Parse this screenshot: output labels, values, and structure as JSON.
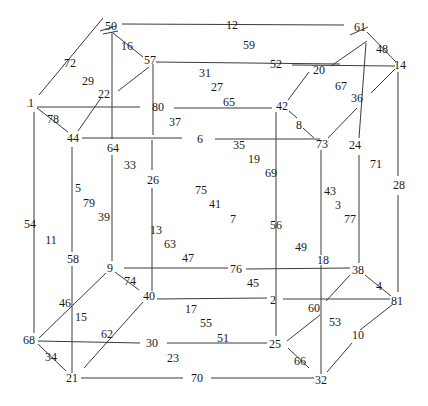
{
  "diagram": {
    "type": "nested-cube graph with numbered labels",
    "stroke_color": "#3a3a3a",
    "text_color": "#1a1a1a",
    "background": "#ffffff",
    "labels": [
      {
        "id": "50",
        "x": 111,
        "y": 26
      },
      {
        "id": "12",
        "x": 232,
        "y": 25
      },
      {
        "id": "61",
        "x": 360,
        "y": 27
      },
      {
        "id": "16",
        "x": 127,
        "y": 46
      },
      {
        "id": "57",
        "x": 150,
        "y": 60
      },
      {
        "id": "59",
        "x": 249,
        "y": 45
      },
      {
        "id": "48",
        "x": 382,
        "y": 49
      },
      {
        "id": "72",
        "x": 70,
        "y": 63
      },
      {
        "id": "52",
        "x": 276,
        "y": 64
      },
      {
        "id": "14",
        "x": 400,
        "y": 65
      },
      {
        "id": "31",
        "x": 205,
        "y": 73
      },
      {
        "id": "20",
        "x": 319,
        "y": 70
      },
      {
        "id": "29",
        "x": 88,
        "y": 81
      },
      {
        "id": "67",
        "x": 341,
        "y": 86
      },
      {
        "id": "27",
        "x": 217,
        "y": 87
      },
      {
        "id": "22",
        "x": 104,
        "y": 94
      },
      {
        "id": "36",
        "x": 357,
        "y": 98
      },
      {
        "id": "1",
        "x": 31,
        "y": 103
      },
      {
        "id": "80",
        "x": 158,
        "y": 107
      },
      {
        "id": "65",
        "x": 229,
        "y": 102
      },
      {
        "id": "42",
        "x": 282,
        "y": 106
      },
      {
        "id": "78",
        "x": 53,
        "y": 119
      },
      {
        "id": "37",
        "x": 175,
        "y": 122
      },
      {
        "id": "8",
        "x": 299,
        "y": 125
      },
      {
        "id": "44",
        "x": 73,
        "y": 138
      },
      {
        "id": "6",
        "x": 200,
        "y": 139
      },
      {
        "id": "35",
        "x": 239,
        "y": 145
      },
      {
        "id": "73",
        "x": 322,
        "y": 144
      },
      {
        "id": "24",
        "x": 355,
        "y": 145
      },
      {
        "id": "64",
        "x": 113,
        "y": 148
      },
      {
        "id": "19",
        "x": 254,
        "y": 159
      },
      {
        "id": "33",
        "x": 130,
        "y": 165
      },
      {
        "id": "71",
        "x": 376,
        "y": 164
      },
      {
        "id": "69",
        "x": 271,
        "y": 173
      },
      {
        "id": "26",
        "x": 153,
        "y": 180
      },
      {
        "id": "5",
        "x": 78,
        "y": 188
      },
      {
        "id": "43",
        "x": 330,
        "y": 191
      },
      {
        "id": "75",
        "x": 201,
        "y": 190
      },
      {
        "id": "28",
        "x": 399,
        "y": 185
      },
      {
        "id": "79",
        "x": 89,
        "y": 203
      },
      {
        "id": "41",
        "x": 215,
        "y": 204
      },
      {
        "id": "3",
        "x": 338,
        "y": 205
      },
      {
        "id": "39",
        "x": 104,
        "y": 217
      },
      {
        "id": "7",
        "x": 233,
        "y": 219
      },
      {
        "id": "77",
        "x": 350,
        "y": 219
      },
      {
        "id": "54",
        "x": 30,
        "y": 224
      },
      {
        "id": "56",
        "x": 276,
        "y": 225
      },
      {
        "id": "13",
        "x": 156,
        "y": 230
      },
      {
        "id": "11",
        "x": 51,
        "y": 240
      },
      {
        "id": "63",
        "x": 170,
        "y": 244
      },
      {
        "id": "49",
        "x": 301,
        "y": 247
      },
      {
        "id": "58",
        "x": 73,
        "y": 259
      },
      {
        "id": "47",
        "x": 188,
        "y": 258
      },
      {
        "id": "18",
        "x": 323,
        "y": 260
      },
      {
        "id": "9",
        "x": 110,
        "y": 268
      },
      {
        "id": "76",
        "x": 236,
        "y": 269
      },
      {
        "id": "38",
        "x": 358,
        "y": 270
      },
      {
        "id": "74",
        "x": 130,
        "y": 281
      },
      {
        "id": "45",
        "x": 253,
        "y": 283
      },
      {
        "id": "4",
        "x": 379,
        "y": 286
      },
      {
        "id": "40",
        "x": 149,
        "y": 296
      },
      {
        "id": "2",
        "x": 273,
        "y": 300
      },
      {
        "id": "81",
        "x": 397,
        "y": 301
      },
      {
        "id": "46",
        "x": 65,
        "y": 303
      },
      {
        "id": "17",
        "x": 191,
        "y": 309
      },
      {
        "id": "60",
        "x": 314,
        "y": 308
      },
      {
        "id": "53",
        "x": 335,
        "y": 322
      },
      {
        "id": "15",
        "x": 81,
        "y": 317
      },
      {
        "id": "55",
        "x": 206,
        "y": 323
      },
      {
        "id": "62",
        "x": 107,
        "y": 334
      },
      {
        "id": "10",
        "x": 358,
        "y": 335
      },
      {
        "id": "51",
        "x": 223,
        "y": 338
      },
      {
        "id": "68",
        "x": 29,
        "y": 340
      },
      {
        "id": "30",
        "x": 152,
        "y": 343
      },
      {
        "id": "25",
        "x": 275,
        "y": 344
      },
      {
        "id": "34",
        "x": 51,
        "y": 357
      },
      {
        "id": "23",
        "x": 173,
        "y": 358
      },
      {
        "id": "66",
        "x": 300,
        "y": 361
      },
      {
        "id": "21",
        "x": 72,
        "y": 378
      },
      {
        "id": "70",
        "x": 197,
        "y": 378
      },
      {
        "id": "32",
        "x": 321,
        "y": 380
      }
    ],
    "edges": [
      [
        122,
        24,
        344,
        25
      ],
      [
        116,
        26,
        100,
        31
      ],
      [
        118,
        31,
        103,
        34
      ],
      [
        103,
        18,
        39,
        95
      ],
      [
        113,
        33,
        143,
        57
      ],
      [
        112,
        32,
        112,
        139
      ],
      [
        156,
        62,
        340,
        64
      ],
      [
        153,
        64,
        153,
        135
      ],
      [
        149,
        67,
        118,
        91
      ],
      [
        37,
        107,
        140,
        107
      ],
      [
        174,
        108,
        272,
        108
      ],
      [
        37,
        108,
        68,
        132
      ],
      [
        101,
        98,
        78,
        131
      ],
      [
        34,
        112,
        34,
        333
      ],
      [
        82,
        138,
        182,
        138
      ],
      [
        215,
        139,
        320,
        139
      ],
      [
        112,
        155,
        112,
        261
      ],
      [
        152,
        140,
        152,
        170
      ],
      [
        152,
        188,
        152,
        291
      ],
      [
        72,
        147,
        72,
        252
      ],
      [
        72,
        266,
        72,
        373
      ],
      [
        368,
        27,
        350,
        35
      ],
      [
        367,
        41,
        331,
        66
      ],
      [
        366,
        43,
        359,
        138
      ],
      [
        367,
        32,
        396,
        62
      ],
      [
        292,
        65,
        395,
        66
      ],
      [
        309,
        72,
        288,
        100
      ],
      [
        289,
        111,
        297,
        118
      ],
      [
        303,
        128,
        314,
        138
      ],
      [
        395,
        69,
        371,
        93
      ],
      [
        357,
        108,
        328,
        138
      ],
      [
        276,
        112,
        276,
        336
      ],
      [
        321,
        150,
        321,
        255
      ],
      [
        359,
        155,
        359,
        263
      ],
      [
        398,
        72,
        398,
        176
      ],
      [
        398,
        195,
        398,
        292
      ],
      [
        124,
        268,
        228,
        268
      ],
      [
        246,
        269,
        350,
        268
      ],
      [
        115,
        272,
        139,
        290
      ],
      [
        106,
        273,
        39,
        338
      ],
      [
        157,
        299,
        267,
        298
      ],
      [
        283,
        299,
        390,
        299
      ],
      [
        143,
        302,
        84,
        368
      ],
      [
        38,
        341,
        140,
        343
      ],
      [
        167,
        343,
        267,
        343
      ],
      [
        38,
        344,
        66,
        371
      ],
      [
        81,
        378,
        183,
        378
      ],
      [
        211,
        378,
        314,
        378
      ],
      [
        321,
        265,
        321,
        374
      ],
      [
        350,
        275,
        326,
        301
      ],
      [
        365,
        275,
        391,
        296
      ],
      [
        320,
        315,
        287,
        341
      ],
      [
        288,
        348,
        309,
        368
      ],
      [
        392,
        305,
        360,
        330
      ],
      [
        352,
        343,
        327,
        372
      ],
      [
        28,
        106,
        28,
        107
      ]
    ]
  }
}
